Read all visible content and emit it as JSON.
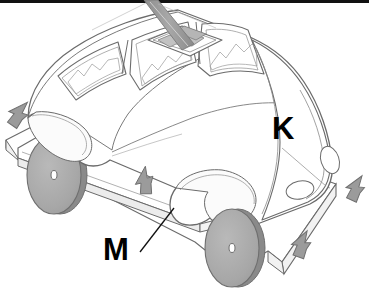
{
  "figure": {
    "background_color": "#ffffff",
    "outline_color": "#6b6b6b",
    "shade_color": "#a9a9a9",
    "wheel_fill": "#a5a5a5",
    "wheel_rim": "#8a8a8a",
    "arrow_fill": "#9b9b9b",
    "arrow_stroke": "#6f6f6f",
    "border_color": "#111111"
  },
  "labels": [
    {
      "id": "label-k",
      "text": "K",
      "x": 282,
      "y": 135,
      "size": 30,
      "note": "label on car hood / front body"
    },
    {
      "id": "label-m",
      "text": "M",
      "x": 112,
      "y": 252,
      "size": 30,
      "note": "label with leader line to side running board"
    }
  ],
  "leader_lines": [
    {
      "id": "leader-m",
      "from_x": 140,
      "from_y": 250,
      "to_x": 172,
      "to_y": 212
    }
  ],
  "arrows": [
    {
      "id": "arrow-rear-left",
      "x": 20,
      "y": 112,
      "rotation": 215,
      "note": "points down-left at rear base plate edge"
    },
    {
      "id": "arrow-mid-bottom",
      "x": 146,
      "y": 178,
      "rotation": 180,
      "note": "points down at side running board"
    },
    {
      "id": "arrow-front-right",
      "x": 357,
      "y": 186,
      "rotation": 205,
      "note": "points down-left at front base plate edge"
    },
    {
      "id": "arrow-front-bottom",
      "x": 302,
      "y": 242,
      "rotation": 200,
      "note": "points down-left at front base plate corner"
    }
  ],
  "wheels": [
    {
      "id": "wheel-rear",
      "cx": 56,
      "cy": 175,
      "rx": 27,
      "ry": 39,
      "hub_rx": 3,
      "hub_ry": 4
    },
    {
      "id": "wheel-front",
      "cx": 232,
      "cy": 248,
      "rx": 27,
      "ry": 39,
      "hub_rx": 3,
      "hub_ry": 4
    }
  ],
  "parts": [
    {
      "id": "base-plate",
      "name": "base-plate",
      "note": "flat rectangular platform under the car"
    },
    {
      "id": "running-board",
      "name": "side-running-board",
      "note": "long rail along the car side, labelled M"
    },
    {
      "id": "car-body",
      "name": "car-body",
      "note": "rounded beetle-style body shell"
    },
    {
      "id": "hood",
      "name": "car-hood",
      "note": "front hood area, labelled K"
    },
    {
      "id": "roof-hatch",
      "name": "roof-hatch",
      "note": "square sunroof opening on the roof"
    },
    {
      "id": "roof-rod",
      "name": "roof-rod",
      "note": "grey rod protruding up out of the roof hatch"
    },
    {
      "id": "window-rear",
      "name": "rear-side-window"
    },
    {
      "id": "window-door",
      "name": "door-side-window"
    },
    {
      "id": "window-front",
      "name": "front-side-window"
    },
    {
      "id": "windshield",
      "name": "windshield"
    },
    {
      "id": "headlight-left",
      "name": "headlight-left"
    },
    {
      "id": "headlight-right",
      "name": "headlight-right"
    }
  ]
}
